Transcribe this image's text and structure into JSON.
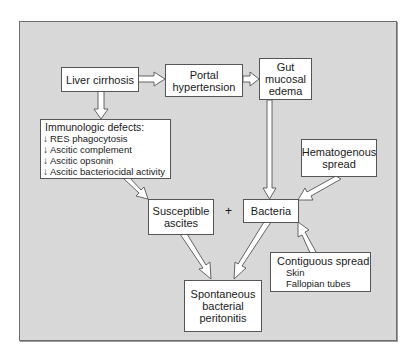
{
  "diagram": {
    "title": "",
    "background_color": "#d8d8d8",
    "nodes": {
      "liver_cirrhosis": {
        "label": "Liver cirrhosis"
      },
      "portal_hypertension": {
        "lines": [
          "Portal",
          "hypertension"
        ]
      },
      "gut_mucosal_edema": {
        "lines": [
          "Gut",
          "mucosal",
          "edema"
        ]
      },
      "immunologic_defects": {
        "title": "Immunologic defects:",
        "items": [
          {
            "indicator": "↓",
            "label": "RES phagocytosis"
          },
          {
            "indicator": "↓",
            "label": "Ascitic complement"
          },
          {
            "indicator": "↓",
            "label": "Ascitic opsonin"
          },
          {
            "indicator": "↓",
            "label": "Ascitic bacteriocidal activity"
          }
        ]
      },
      "hematogenous_spread": {
        "lines": [
          "Hematogenous",
          "spread"
        ]
      },
      "susceptible_ascites": {
        "lines": [
          "Susceptible",
          "ascites"
        ]
      },
      "plus": "+",
      "bacteria": {
        "label": "Bacteria"
      },
      "contiguous_spread": {
        "title": "Contiguous spread",
        "items": [
          "Skin",
          "Fallopian tubes"
        ]
      },
      "sbp": {
        "lines": [
          "Spontaneous",
          "bacterial",
          "peritonitis"
        ]
      }
    },
    "edges": [
      {
        "from": "Liver cirrhosis",
        "to": "Portal hypertension"
      },
      {
        "from": "Portal hypertension",
        "to": "Gut mucosal edema"
      },
      {
        "from": "Liver cirrhosis",
        "to": "Immunologic defects"
      },
      {
        "from": "Gut mucosal edema",
        "to": "Bacteria"
      },
      {
        "from": "Hematogenous spread",
        "to": "Bacteria"
      },
      {
        "from": "Contiguous spread",
        "to": "Bacteria"
      },
      {
        "from": "Immunologic defects",
        "to": "Susceptible ascites"
      },
      {
        "from": "Susceptible ascites",
        "to": "Spontaneous bacterial peritonitis"
      },
      {
        "from": "Bacteria",
        "to": "Spontaneous bacterial peritonitis"
      }
    ]
  }
}
